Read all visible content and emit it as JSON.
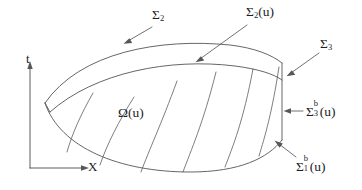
{
  "figure": {
    "kind": "lens-shaped spacetime domain diagram",
    "background_color": "#ffffff",
    "line_color": "#555558",
    "text_color": "#1d1d1f",
    "width": 362,
    "height": 190
  },
  "axes": {
    "vertical_label": "t",
    "horizontal_label": "X",
    "origin_x": 30,
    "origin_y": 168,
    "vertical_top_y": 63,
    "horizontal_right_x": 88
  },
  "labels": {
    "omega": {
      "sigma": "Ω",
      "arg": "(u)",
      "x": 118,
      "y": 113
    },
    "sigma2": {
      "sigma": "Σ",
      "sub": "2",
      "x": 154,
      "y": 15
    },
    "sigma2u": {
      "sigma": "Σ",
      "sub": "2",
      "arg": "(u)",
      "x": 248,
      "y": 12
    },
    "sigma3": {
      "sigma": "Σ",
      "sub": "3",
      "x": 322,
      "y": 44
    },
    "sigma3b_u": {
      "sigma": "Σ",
      "sub": "3",
      "sup": "b",
      "arg": "(u)",
      "x": 307,
      "y": 108
    },
    "sigma1b_u": {
      "sigma": "Σ",
      "sub": "1",
      "sup": "b",
      "arg": "(u)",
      "x": 297,
      "y": 163
    }
  },
  "geometry": {
    "outer_top_curve": "M 45,103 C 80,52 160,38 230,45 C 255,48 272,55 282,63",
    "inner_top_curve": "M 50,112 C 95,72 170,58 235,66 C 258,69 274,74 282,80",
    "bottom_curve": "M 45,103 C 60,148 120,172 190,172 C 240,172 268,158 282,140",
    "right_edge": "M 282,63 L 282,140",
    "hatch_lines": [
      "M 66,153 C 72,133 82,112 92,92",
      "M 99,166 C 108,143 120,120 133,98",
      "M 140,172 C 150,148 162,123 176,83",
      "M 182,172 C 192,148 204,122 215,73",
      "M 224,168 C 233,145 243,122 252,69",
      "M 258,157 C 265,135 272,112 278,67"
    ],
    "leaders": [
      {
        "name": "sigma2",
        "from": [
          151,
          27
        ],
        "to": [
          125,
          42
        ]
      },
      {
        "name": "sigma2u",
        "from": [
          247,
          25
        ],
        "to": [
          196,
          62
        ]
      },
      {
        "name": "sigma3",
        "from": [
          318,
          54
        ],
        "to": [
          288,
          76
        ]
      },
      {
        "name": "sigma3b_u",
        "from": [
          303,
          112
        ],
        "to": [
          283,
          112
        ]
      },
      {
        "name": "sigma1b_u",
        "from": [
          296,
          158
        ],
        "to": [
          275,
          143
        ]
      }
    ]
  }
}
